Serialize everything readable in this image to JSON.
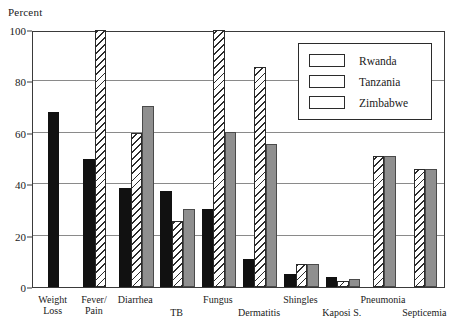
{
  "chart_data": {
    "type": "bar",
    "title": "",
    "ylabel": "Percent",
    "xlabel": "",
    "ylim": [
      0,
      100
    ],
    "yticks": [
      0,
      20,
      40,
      60,
      80,
      100
    ],
    "grid": true,
    "legend_position": "top-right",
    "categories": [
      "Weight\nLoss",
      "Fever/\nPain",
      "Diarrhea",
      "TB",
      "Fungus",
      "Dermatitis",
      "Shingles",
      "Kaposi S.",
      "Pneumonia",
      "Septicemia"
    ],
    "series": [
      {
        "name": "Rwanda",
        "color": "#111111",
        "pattern": "solid-black",
        "values": [
          68,
          50,
          38.5,
          37.5,
          30.5,
          11,
          5,
          4,
          null,
          null
        ]
      },
      {
        "name": "Tanzania",
        "color": "#ffffff",
        "pattern": "diagonal-hatch",
        "values": [
          null,
          100,
          60,
          25.5,
          100,
          85.5,
          9,
          2.5,
          51,
          46
        ]
      },
      {
        "name": "Zimbabwe",
        "color": "#8f8f8f",
        "pattern": "solid-gray",
        "values": [
          null,
          null,
          70.5,
          30.5,
          60.5,
          55.5,
          9,
          3,
          51,
          46
        ]
      }
    ]
  },
  "legend": {
    "items": [
      {
        "label": "Rwanda",
        "swatch": "rwanda"
      },
      {
        "label": "Tanzania",
        "swatch": "tanzania"
      },
      {
        "label": "Zimbabwe",
        "swatch": "zimbabwe"
      }
    ]
  },
  "axis": {
    "y_title": "Percent"
  }
}
